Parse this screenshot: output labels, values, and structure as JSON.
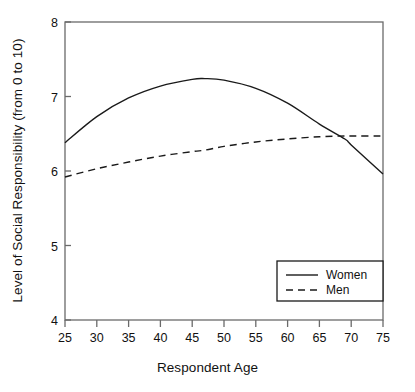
{
  "chart_data": {
    "type": "line",
    "title": "",
    "xlabel": "Respondent Age",
    "ylabel": "Level of Social Responsibility (from 0 to 10)",
    "xlim": [
      25,
      75
    ],
    "ylim": [
      4,
      8
    ],
    "xticks": [
      25,
      30,
      35,
      40,
      45,
      50,
      55,
      60,
      65,
      70,
      75
    ],
    "yticks": [
      4,
      5,
      6,
      7,
      8
    ],
    "grid": false,
    "legend_position": "lower right",
    "x": [
      25,
      30,
      35,
      40,
      45,
      47,
      50,
      55,
      60,
      65,
      69,
      70,
      75
    ],
    "series": [
      {
        "name": "Women",
        "style": "solid",
        "color": "#1a1a1a",
        "values": [
          6.38,
          6.73,
          6.98,
          7.14,
          7.23,
          7.24,
          7.22,
          7.11,
          6.91,
          6.63,
          6.43,
          6.35,
          5.96
        ]
      },
      {
        "name": "Men",
        "style": "dashed",
        "color": "#1a1a1a",
        "values": [
          5.92,
          6.03,
          6.12,
          6.2,
          6.26,
          6.28,
          6.33,
          6.39,
          6.43,
          6.46,
          6.47,
          6.47,
          6.47
        ]
      }
    ],
    "annotations": [
      {
        "label": "women-peak",
        "x": 47,
        "y": 7.24
      },
      {
        "label": "curves-crossover",
        "x": 69,
        "y": 6.43
      }
    ]
  },
  "legend": {
    "entries": [
      {
        "label": "Women",
        "style": "solid"
      },
      {
        "label": "Men",
        "style": "dashed"
      }
    ]
  },
  "colors": {
    "background": "#ffffff",
    "axis": "#555555",
    "line": "#1a1a1a",
    "text": "#111111"
  }
}
